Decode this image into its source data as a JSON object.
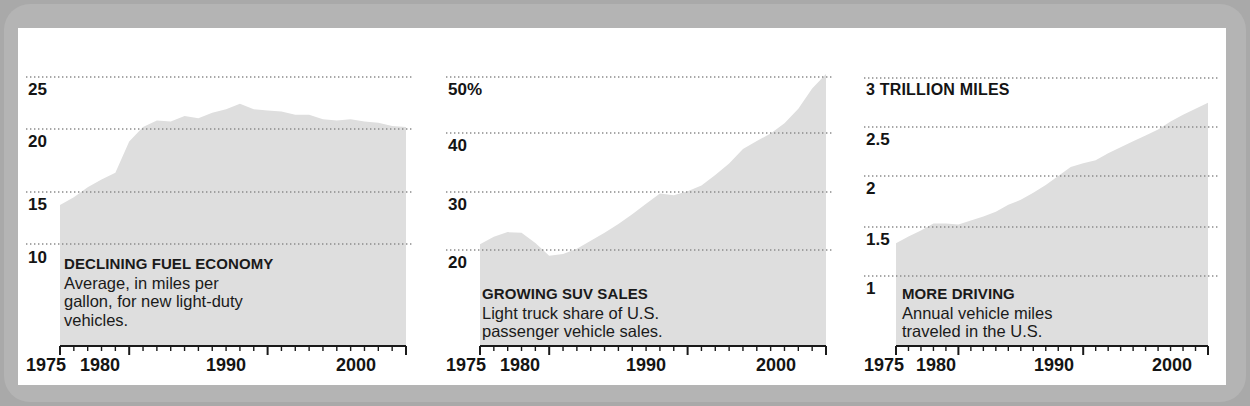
{
  "figure": {
    "background_color": "#a9a9a9",
    "bezel_color": "#b4b4b4",
    "panel_color": "#ffffff",
    "area_fill_color": "#dedede",
    "gridline_color": "#8a8a8a",
    "axis_color": "#1a1a1a",
    "text_color": "#1a1a1a"
  },
  "charts": [
    {
      "id": "declining-fuel-economy",
      "caption_title": "DECLINING FUEL ECONOMY",
      "caption_lines": [
        "Average, in miles per",
        "gallon, for new light-duty",
        "vehicles."
      ],
      "y_ticks": [
        "25",
        "20",
        "15",
        "10"
      ],
      "x_ticks": [
        "1975",
        "1980",
        "1990",
        "2000"
      ]
    },
    {
      "id": "growing-suv-sales",
      "caption_title": "GROWING SUV SALES",
      "caption_lines": [
        "Light truck share of U.S.",
        "passenger vehicle sales."
      ],
      "y_ticks": [
        "50%",
        "40",
        "30",
        "20"
      ],
      "x_ticks": [
        "1975",
        "1980",
        "1990",
        "2000"
      ]
    },
    {
      "id": "more-driving",
      "caption_title": "MORE DRIVING",
      "caption_lines": [
        "Annual vehicle miles",
        "traveled in the U.S."
      ],
      "y_ticks": [
        "3 TRILLION MILES",
        "2.5",
        "2",
        "1.5",
        "1"
      ],
      "x_ticks": [
        "1975",
        "1980",
        "1990",
        "2000"
      ]
    }
  ],
  "chart_data": [
    {
      "type": "area",
      "id": "declining-fuel-economy",
      "title": "DECLINING FUEL ECONOMY",
      "subtitle": "Average, in miles per gallon, for new light-duty vehicles.",
      "xlabel": "",
      "ylabel": "miles per gallon",
      "xlim": [
        1975,
        2000
      ],
      "ylim": [
        7.5,
        26.5
      ],
      "yticks": [
        10,
        15,
        25
      ],
      "ytick_extra": [
        20
      ],
      "xticks": [
        1975,
        1980,
        1990,
        2000
      ],
      "grid": true,
      "legend": "none",
      "x": [
        1975,
        1976,
        1977,
        1978,
        1979,
        1980,
        1981,
        1982,
        1983,
        1984,
        1985,
        1986,
        1987,
        1988,
        1989,
        1990,
        1991,
        1992,
        1993,
        1994,
        1995,
        1996,
        1997,
        1998,
        1999,
        2000
      ],
      "values": [
        13.5,
        14.2,
        15.1,
        15.8,
        16.4,
        19.2,
        20.5,
        21.1,
        21.0,
        21.5,
        21.3,
        21.8,
        22.1,
        22.6,
        22.1,
        22.0,
        21.9,
        21.6,
        21.6,
        21.2,
        21.1,
        21.2,
        21.0,
        20.9,
        20.6,
        20.5
      ]
    },
    {
      "type": "area",
      "id": "growing-suv-sales",
      "title": "GROWING SUV SALES",
      "subtitle": "Light truck share of U.S. passenger vehicle sales.",
      "xlabel": "",
      "ylabel": "percent share",
      "xlim": [
        1975,
        2000
      ],
      "ylim": [
        14,
        53
      ],
      "yticks": [
        20,
        30,
        40,
        50
      ],
      "xticks": [
        1975,
        1980,
        1990,
        2000
      ],
      "grid": true,
      "legend": "none",
      "x": [
        1975,
        1976,
        1977,
        1978,
        1979,
        1980,
        1981,
        1982,
        1983,
        1984,
        1985,
        1986,
        1987,
        1988,
        1989,
        1990,
        1991,
        1992,
        1993,
        1994,
        1995,
        1996,
        1997,
        1998,
        1999,
        2000
      ],
      "values": [
        21.0,
        22.3,
        23.1,
        23.0,
        21.2,
        19.0,
        19.3,
        20.2,
        21.6,
        23.0,
        24.5,
        26.2,
        28.0,
        29.8,
        29.5,
        30.2,
        31.2,
        33.0,
        35.0,
        37.5,
        38.9,
        40.2,
        42.0,
        44.5,
        48.0,
        50.5
      ]
    },
    {
      "type": "area",
      "id": "more-driving",
      "title": "MORE DRIVING",
      "subtitle": "Annual vehicle miles traveled in the U.S.",
      "xlabel": "",
      "ylabel": "trillion miles",
      "xlim": [
        1975,
        2000
      ],
      "ylim": [
        0.6,
        3.1
      ],
      "yticks": [
        1,
        1.5,
        2,
        2.5,
        3
      ],
      "xticks": [
        1975,
        1980,
        1990,
        2000
      ],
      "grid": true,
      "legend": "none",
      "x": [
        1975,
        1976,
        1977,
        1978,
        1979,
        1980,
        1981,
        1982,
        1983,
        1984,
        1985,
        1986,
        1987,
        1988,
        1989,
        1990,
        1991,
        1992,
        1993,
        1994,
        1995,
        1996,
        1997,
        1998,
        1999,
        2000
      ],
      "values": [
        1.33,
        1.4,
        1.46,
        1.53,
        1.53,
        1.52,
        1.56,
        1.6,
        1.65,
        1.72,
        1.77,
        1.84,
        1.92,
        2.01,
        2.1,
        2.14,
        2.17,
        2.24,
        2.3,
        2.36,
        2.42,
        2.48,
        2.56,
        2.63,
        2.69,
        2.75
      ]
    }
  ]
}
